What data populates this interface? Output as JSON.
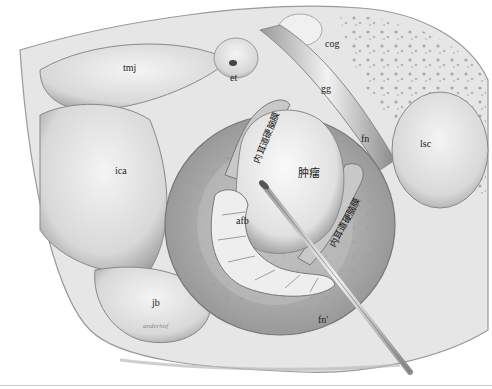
{
  "illustration": {
    "subject": "Surgical field view: tumor within internal auditory canal",
    "labels": {
      "tmj": "tmj",
      "et": "et",
      "cog": "cog",
      "gg": "gg",
      "fn": "fn",
      "lsc": "lsc",
      "ica": "ica",
      "tumor": "肿瘤",
      "afb": "afb",
      "jb": "jb",
      "fn_prime": "fn'",
      "iac_dura_upper": "内耳道硬脑膜",
      "iac_dura_lower": "内耳道硬脑膜"
    },
    "signature": "anderhuf"
  }
}
